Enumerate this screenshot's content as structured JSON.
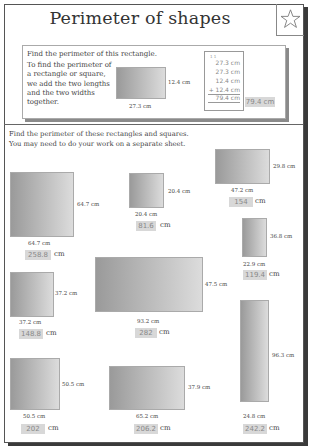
{
  "header": {
    "title": "Perimeter of shapes",
    "icon": "star-icon"
  },
  "example": {
    "instruction": "Find the perimeter of this rectangle.",
    "explanation": "To find the perimeter of a rectangle or square, we add the two lengths and the two widths together.",
    "rectangle": {
      "length": "27.3 cm",
      "width": "12.4 cm"
    },
    "calculation": {
      "carry": "1 1",
      "lines": [
        "27.3 cm",
        "27.3 cm",
        "12.4 cm",
        "+ 12.4 cm"
      ],
      "total": "79.4 cm"
    },
    "answer": "79.4 cm"
  },
  "exercise": {
    "instruction_line1": "Find the perimeter of these rectangles and squares.",
    "instruction_line2": "You may need to do your work on a separate sheet.",
    "unit": "cm",
    "shapes": [
      {
        "side": "64.7 cm",
        "bottom": "64.7 cm",
        "answer": "258.8"
      },
      {
        "side": "20.4 cm",
        "bottom": "20.4 cm",
        "answer": "81.6"
      },
      {
        "side": "29.8 cm",
        "bottom": "47.2 cm",
        "answer": "154"
      },
      {
        "side": "36.8 cm",
        "bottom": "22.9 cm",
        "answer": "119.4"
      },
      {
        "side": "37.2 cm",
        "bottom": "37.2 cm",
        "answer": "148.8"
      },
      {
        "side": "47.5 cm",
        "bottom": "93.2 cm",
        "answer": "282"
      },
      {
        "side": "50.5 cm",
        "bottom": "50.5 cm",
        "answer": "202"
      },
      {
        "side": "37.9 cm",
        "bottom": "65.2 cm",
        "answer": "206.2"
      },
      {
        "side": "96.3 cm",
        "bottom": "24.8 cm",
        "answer": "242.2"
      }
    ]
  }
}
